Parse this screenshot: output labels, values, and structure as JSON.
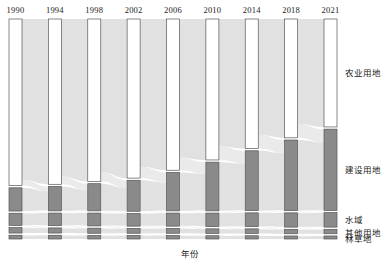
{
  "chart_data": {
    "type": "sankey",
    "title": "",
    "xlabel": "年份",
    "ylabel": "",
    "grid": false,
    "legend_position": "right",
    "categories": [
      "1990",
      "1994",
      "1998",
      "2002",
      "2006",
      "2010",
      "2014",
      "2018",
      "2021"
    ],
    "class_names": [
      "农业用地",
      "建设用地",
      "水域",
      "其他用地",
      "林草地"
    ],
    "series": [
      {
        "name": "农业用地",
        "values": [
          71.0,
          70.6,
          69.4,
          67.8,
          64.6,
          60.2,
          55.4,
          50.8,
          46.2
        ]
      },
      {
        "name": "建设用地",
        "values": [
          9.9,
          10.4,
          11.6,
          13.2,
          16.4,
          20.8,
          25.6,
          30.2,
          34.8
        ]
      },
      {
        "name": "水域",
        "values": [
          5.2,
          5.4,
          5.5,
          5.4,
          5.6,
          5.8,
          5.9,
          6.1,
          6.2
        ]
      },
      {
        "name": "其他用地",
        "values": [
          2.3,
          2.2,
          2.2,
          2.1,
          2.1,
          2.0,
          2.0,
          1.9,
          1.9
        ]
      },
      {
        "name": "林草地",
        "values": [
          1.6,
          1.6,
          1.5,
          1.5,
          1.5,
          1.4,
          1.4,
          1.3,
          1.3
        ]
      }
    ],
    "colors": {
      "agriculture": "#ffffff",
      "construction": "#8a8a8a",
      "water": "#8a8a8a",
      "other": "#8a8a8a",
      "forest": "#8a8a8a",
      "node_stroke": "#555555",
      "ribbon": "#cfcfcf",
      "ribbon_light": "#e3e3e3"
    }
  },
  "legend": {
    "items": [
      {
        "label": "农业用地"
      },
      {
        "label": "建设用地"
      },
      {
        "label": "水域"
      },
      {
        "label": "其他用地"
      },
      {
        "label": "林草地"
      }
    ]
  },
  "axis": {
    "x_title": "年份"
  }
}
